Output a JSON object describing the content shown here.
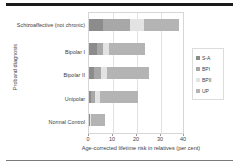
{
  "chart_data": {
    "type": "bar",
    "orientation": "horizontal",
    "stacked": true,
    "title": "",
    "xlabel": "Age-corrected lifetime risk in relatives (per cent)",
    "ylabel": "Proband diagnosis",
    "categories": [
      "Schizoaffective (not chronic)",
      "Bipolar I",
      "Bipolar II",
      "Unipolar",
      "Normal Control"
    ],
    "series": [
      {
        "name": "S-A",
        "values": [
          6.0,
          3.5,
          2.0,
          1.0,
          0.3
        ]
      },
      {
        "name": "BPI",
        "values": [
          11.0,
          2.5,
          3.0,
          1.5,
          0.2
        ]
      },
      {
        "name": "BPII",
        "values": [
          6.0,
          2.5,
          2.5,
          2.0,
          0.3
        ]
      },
      {
        "name": "UP",
        "values": [
          14.5,
          15.0,
          17.5,
          16.0,
          5.7
        ]
      }
    ],
    "totals": [
      37.5,
      23.5,
      25.0,
      20.5,
      6.5
    ],
    "xlim": [
      0,
      40
    ],
    "xticks": [
      0,
      10,
      20,
      30,
      40
    ],
    "xtick_labels": [
      "0",
      "10",
      "20",
      "30",
      "40"
    ],
    "grid": true,
    "legend_position": "right",
    "colors": {
      "S-A": "#8c8c8c",
      "BPI": "#a8a8a8",
      "BPII": "#e3e3e3",
      "UP": "#b4b4b4",
      "axis_text": "#3d3d3d",
      "gridline": "#e2e2e2",
      "frame": "#d6d6d6",
      "rule": "#1a1a1a"
    }
  }
}
